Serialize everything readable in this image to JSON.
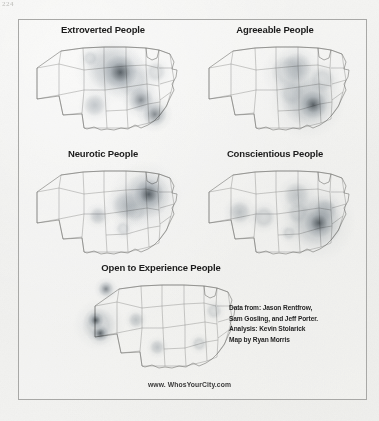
{
  "page": {
    "page_number": "224",
    "background_color": "#f1f1ef",
    "frame_color": "#a8a8a6"
  },
  "footer": {
    "url": "www. WhosYourCity.com"
  },
  "credits": {
    "line1": "Data from: Jason Rentfrow,",
    "line2": "Sam Gosling, and Jeff Porter.",
    "line3": "Analysis: Kevin Stolarick",
    "line4": "Map by Ryan Morris"
  },
  "chart_data": {
    "type": "heatmap",
    "subtitle": "",
    "xlabel": "",
    "ylabel": "",
    "legend_position": "none",
    "grid": false,
    "colormap": {
      "low": "#cfd4d8",
      "mid": "#9aa3ab",
      "high": "#5d666e",
      "peak": "#3f484f"
    },
    "projection": "contiguous United States with state boundaries",
    "panels": [
      {
        "id": "extroverted",
        "title": "Extroverted People",
        "row": 1,
        "column": 1,
        "hotspots": [
          {
            "label": "Chicago / Great Lakes",
            "x": 0.615,
            "y": 0.345,
            "radius": 0.175,
            "intensity": 1.0
          },
          {
            "label": "Upper Midwest spread",
            "x": 0.545,
            "y": 0.3,
            "radius": 0.24,
            "intensity": 0.42
          },
          {
            "label": "Ohio Valley",
            "x": 0.7,
            "y": 0.44,
            "radius": 0.17,
            "intensity": 0.35
          },
          {
            "label": "Atlanta / Southeast",
            "x": 0.755,
            "y": 0.645,
            "radius": 0.13,
            "intensity": 0.78
          },
          {
            "label": "Florida",
            "x": 0.845,
            "y": 0.8,
            "radius": 0.125,
            "intensity": 0.82
          },
          {
            "label": "Texas / Southern Plains",
            "x": 0.445,
            "y": 0.7,
            "radius": 0.115,
            "intensity": 0.45
          },
          {
            "label": "Northern Plains",
            "x": 0.415,
            "y": 0.195,
            "radius": 0.075,
            "intensity": 0.3
          },
          {
            "label": "Northeast corridor",
            "x": 0.855,
            "y": 0.345,
            "radius": 0.1,
            "intensity": 0.26
          }
        ]
      },
      {
        "id": "agreeable",
        "title": "Agreeable People",
        "row": 1,
        "column": 2,
        "hotspots": [
          {
            "label": "Deep South / Gulf",
            "x": 0.755,
            "y": 0.695,
            "radius": 0.145,
            "intensity": 0.95
          },
          {
            "label": "Southeast broad",
            "x": 0.715,
            "y": 0.655,
            "radius": 0.26,
            "intensity": 0.45
          },
          {
            "label": "Great Lakes band",
            "x": 0.645,
            "y": 0.3,
            "radius": 0.155,
            "intensity": 0.5
          },
          {
            "label": "Upper Midwest",
            "x": 0.585,
            "y": 0.345,
            "radius": 0.175,
            "intensity": 0.33
          },
          {
            "label": "Mid-Atlantic",
            "x": 0.815,
            "y": 0.43,
            "radius": 0.13,
            "intensity": 0.3
          },
          {
            "label": "Mississippi Valley",
            "x": 0.615,
            "y": 0.565,
            "radius": 0.13,
            "intensity": 0.28
          }
        ]
      },
      {
        "id": "neurotic",
        "title": "Neurotic People",
        "row": 2,
        "column": 1,
        "hotspots": [
          {
            "label": "New York / Northeast",
            "x": 0.805,
            "y": 0.325,
            "radius": 0.155,
            "intensity": 1.0
          },
          {
            "label": "Northeast halo",
            "x": 0.785,
            "y": 0.345,
            "radius": 0.245,
            "intensity": 0.42
          },
          {
            "label": "Ohio Valley",
            "x": 0.655,
            "y": 0.445,
            "radius": 0.145,
            "intensity": 0.55
          },
          {
            "label": "Appalachia",
            "x": 0.715,
            "y": 0.5,
            "radius": 0.115,
            "intensity": 0.35
          },
          {
            "label": "Southern Plains",
            "x": 0.465,
            "y": 0.555,
            "radius": 0.09,
            "intensity": 0.42
          },
          {
            "label": "Gulf Coast",
            "x": 0.635,
            "y": 0.695,
            "radius": 0.075,
            "intensity": 0.22
          }
        ]
      },
      {
        "id": "conscientious",
        "title": "Conscientious People",
        "row": 2,
        "column": 2,
        "hotspots": [
          {
            "label": "Southeast core",
            "x": 0.795,
            "y": 0.635,
            "radius": 0.15,
            "intensity": 0.95
          },
          {
            "label": "Southeast halo",
            "x": 0.775,
            "y": 0.625,
            "radius": 0.27,
            "intensity": 0.42
          },
          {
            "label": "Mid-Atlantic",
            "x": 0.835,
            "y": 0.495,
            "radius": 0.115,
            "intensity": 0.55
          },
          {
            "label": "Great Lakes",
            "x": 0.645,
            "y": 0.335,
            "radius": 0.135,
            "intensity": 0.4
          },
          {
            "label": "Southwest / New Mexico",
            "x": 0.265,
            "y": 0.52,
            "radius": 0.115,
            "intensity": 0.48
          },
          {
            "label": "Southern Plains",
            "x": 0.425,
            "y": 0.575,
            "radius": 0.115,
            "intensity": 0.38
          },
          {
            "label": "Gulf Coast",
            "x": 0.595,
            "y": 0.745,
            "radius": 0.07,
            "intensity": 0.3
          },
          {
            "label": "Mississippi Valley",
            "x": 0.655,
            "y": 0.525,
            "radius": 0.115,
            "intensity": 0.3
          }
        ]
      },
      {
        "id": "open-to-experience",
        "title": "Open to Experience People",
        "row": 3,
        "column": 1,
        "hotspots": [
          {
            "label": "San Francisco Bay Area",
            "x": 0.065,
            "y": 0.455,
            "radius": 0.085,
            "intensity": 1.0
          },
          {
            "label": "Los Angeles",
            "x": 0.095,
            "y": 0.595,
            "radius": 0.085,
            "intensity": 0.95
          },
          {
            "label": "Seattle / Pacific Northwest",
            "x": 0.135,
            "y": 0.115,
            "radius": 0.08,
            "intensity": 0.8
          },
          {
            "label": "West Coast halo",
            "x": 0.085,
            "y": 0.5,
            "radius": 0.175,
            "intensity": 0.35
          },
          {
            "label": "Colorado / Mountain West",
            "x": 0.335,
            "y": 0.455,
            "radius": 0.08,
            "intensity": 0.45
          },
          {
            "label": "Texas",
            "x": 0.475,
            "y": 0.745,
            "radius": 0.075,
            "intensity": 0.42
          },
          {
            "label": "Northeast",
            "x": 0.855,
            "y": 0.355,
            "radius": 0.08,
            "intensity": 0.3
          },
          {
            "label": "Southeast",
            "x": 0.755,
            "y": 0.705,
            "radius": 0.075,
            "intensity": 0.35
          }
        ]
      }
    ]
  }
}
